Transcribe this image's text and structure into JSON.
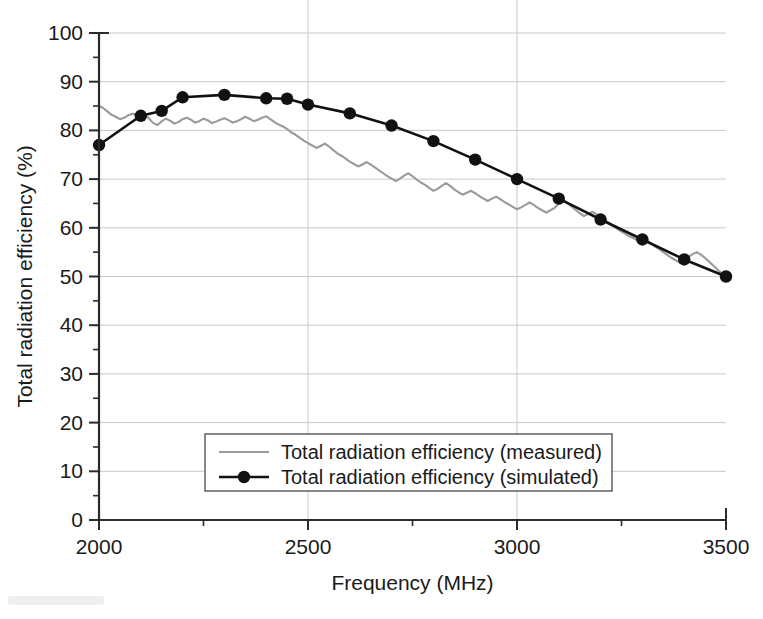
{
  "figure": {
    "background": "#ffffff",
    "plot": {
      "left": 99,
      "right": 726,
      "top": 33,
      "bottom": 520
    }
  },
  "axes": {
    "x": {
      "label": "Frequency (MHz)",
      "min": 2000,
      "max": 3500,
      "major_ticks": [
        2000,
        2500,
        3000,
        3500
      ],
      "major_tick_labels": [
        "2000",
        "2500",
        "3000",
        "3500"
      ],
      "minor_step": 250,
      "gridlines": true
    },
    "y": {
      "label": "Total radiation efficiency (%)",
      "min": 0,
      "max": 100,
      "major_ticks": [
        0,
        10,
        20,
        30,
        40,
        50,
        60,
        70,
        80,
        90,
        100
      ],
      "major_tick_labels": [
        "0",
        "10",
        "20",
        "30",
        "40",
        "50",
        "60",
        "70",
        "80",
        "90",
        "100"
      ],
      "minor_step": 5,
      "gridlines": true
    }
  },
  "legend": {
    "position": "inside-lower-center",
    "box": {
      "x": 205,
      "y": 434,
      "width": 407,
      "height": 57
    },
    "entries": [
      {
        "label": "Total radiation efficiency (measured)",
        "color": "#9a9a9a",
        "marker": "none"
      },
      {
        "label": "Total radiation efficiency (simulated)",
        "color": "#111111",
        "marker": "circle"
      }
    ]
  },
  "colors": {
    "measured": "#9a9a9a",
    "simulated": "#111111",
    "grid": "#c8c8c8",
    "axis": "#2b2b2b"
  },
  "chart_data": {
    "type": "line",
    "title": "",
    "xlabel": "Frequency (MHz)",
    "ylabel": "Total radiation efficiency (%)",
    "xlim": [
      2000,
      3500
    ],
    "ylim": [
      0,
      100
    ],
    "grid": true,
    "legend_position": "inside-lower-center",
    "series": [
      {
        "name": "Total radiation efficiency (measured)",
        "color": "#9a9a9a",
        "style": "solid-noisy",
        "marker": "none",
        "x": [
          2000,
          2010,
          2020,
          2030,
          2040,
          2050,
          2060,
          2070,
          2080,
          2090,
          2100,
          2110,
          2120,
          2130,
          2140,
          2150,
          2160,
          2170,
          2180,
          2190,
          2200,
          2210,
          2220,
          2230,
          2240,
          2250,
          2260,
          2270,
          2280,
          2290,
          2300,
          2310,
          2320,
          2330,
          2340,
          2350,
          2360,
          2370,
          2380,
          2390,
          2400,
          2410,
          2420,
          2430,
          2440,
          2450,
          2460,
          2470,
          2480,
          2490,
          2500,
          2510,
          2520,
          2530,
          2540,
          2550,
          2560,
          2570,
          2580,
          2590,
          2600,
          2610,
          2620,
          2630,
          2640,
          2650,
          2660,
          2670,
          2680,
          2690,
          2700,
          2710,
          2720,
          2730,
          2740,
          2750,
          2760,
          2770,
          2780,
          2790,
          2800,
          2810,
          2820,
          2830,
          2840,
          2850,
          2860,
          2870,
          2880,
          2890,
          2900,
          2910,
          2920,
          2930,
          2940,
          2950,
          2960,
          2970,
          2980,
          2990,
          3000,
          3010,
          3020,
          3030,
          3040,
          3050,
          3060,
          3070,
          3080,
          3090,
          3100,
          3110,
          3120,
          3130,
          3140,
          3150,
          3160,
          3170,
          3180,
          3190,
          3200,
          3210,
          3220,
          3230,
          3240,
          3250,
          3260,
          3270,
          3280,
          3290,
          3300,
          3310,
          3320,
          3330,
          3340,
          3350,
          3360,
          3370,
          3380,
          3390,
          3400,
          3410,
          3420,
          3430,
          3440,
          3450,
          3460,
          3470,
          3480,
          3490,
          3500
        ],
        "y": [
          85.0,
          84.6,
          83.9,
          83.2,
          82.8,
          82.3,
          82.6,
          83.1,
          83.4,
          83.2,
          83.6,
          83.2,
          82.4,
          81.5,
          81.1,
          81.9,
          82.4,
          82.0,
          81.4,
          81.7,
          82.3,
          82.6,
          82.2,
          81.6,
          81.9,
          82.4,
          82.1,
          81.5,
          81.8,
          82.2,
          82.5,
          82.1,
          81.6,
          81.9,
          82.3,
          82.8,
          82.4,
          81.9,
          82.2,
          82.6,
          82.9,
          82.3,
          81.7,
          81.2,
          80.8,
          80.3,
          79.6,
          79.1,
          78.5,
          77.9,
          77.4,
          76.9,
          76.4,
          76.8,
          77.3,
          76.7,
          76.0,
          75.3,
          74.8,
          74.2,
          73.6,
          73.1,
          72.6,
          73.0,
          73.5,
          73.0,
          72.4,
          71.8,
          71.2,
          70.6,
          70.1,
          69.6,
          70.1,
          70.7,
          71.2,
          70.6,
          69.9,
          69.3,
          68.8,
          68.2,
          67.6,
          68.0,
          68.6,
          69.2,
          68.6,
          67.9,
          67.3,
          66.8,
          67.2,
          67.6,
          67.1,
          66.5,
          66.0,
          65.5,
          66.0,
          66.4,
          65.9,
          65.3,
          64.8,
          64.3,
          63.8,
          64.2,
          64.7,
          65.2,
          64.7,
          64.1,
          63.6,
          63.1,
          63.6,
          64.1,
          65.0,
          65.6,
          65.1,
          64.4,
          63.7,
          63.0,
          62.4,
          62.8,
          63.3,
          62.8,
          62.2,
          61.6,
          61.0,
          60.4,
          59.8,
          59.2,
          58.7,
          58.2,
          57.8,
          57.4,
          57.9,
          57.4,
          56.8,
          56.2,
          55.6,
          55.0,
          54.4,
          53.8,
          53.3,
          52.8,
          53.4,
          54.0,
          54.6,
          55.0,
          54.5,
          53.8,
          53.0,
          52.2,
          51.4,
          50.6,
          50.0
        ]
      },
      {
        "name": "Total radiation efficiency (simulated)",
        "color": "#111111",
        "style": "solid-smooth",
        "marker": "circle",
        "x": [
          2000,
          2100,
          2150,
          2200,
          2300,
          2400,
          2450,
          2500,
          2600,
          2700,
          2800,
          2900,
          3000,
          3100,
          3200,
          3300,
          3400,
          3500
        ],
        "y": [
          77.0,
          83.0,
          84.0,
          86.8,
          87.3,
          86.6,
          86.5,
          85.3,
          83.5,
          81.0,
          77.8,
          74.0,
          70.0,
          66.0,
          61.7,
          57.6,
          53.5,
          50.0
        ]
      }
    ]
  }
}
